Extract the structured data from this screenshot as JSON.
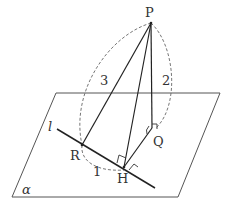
{
  "diagram": {
    "type": "3d-geometry",
    "plane": {
      "label": "α",
      "corners": [
        [
          56,
          93
        ],
        [
          220,
          93
        ],
        [
          178,
          197
        ],
        [
          12,
          197
        ]
      ]
    },
    "line": {
      "label": "l",
      "from": [
        57,
        129
      ],
      "to": [
        155,
        188
      ]
    },
    "points": {
      "P": {
        "label": "P",
        "pos": [
          151,
          23
        ]
      },
      "R": {
        "label": "R",
        "pos": [
          82,
          145
        ]
      },
      "H": {
        "label": "H",
        "pos": [
          124,
          167
        ]
      },
      "Q": {
        "label": "Q",
        "pos": [
          152,
          128
        ]
      }
    },
    "segments": [
      {
        "name": "PR",
        "from": "P",
        "to": "R"
      },
      {
        "name": "PH",
        "from": "P",
        "to": "H"
      },
      {
        "name": "PQ",
        "from": "P",
        "to": "Q"
      },
      {
        "name": "QH",
        "from": "Q",
        "to": "H"
      }
    ],
    "lengths": {
      "PR": "3",
      "PQ": "2",
      "RH": "1"
    },
    "right_angles": [
      "PQ ⊥ plane at Q",
      "PH ⊥ l at H",
      "QH ⊥ l at H"
    ],
    "colors": {
      "stroke": "#222222",
      "plane": "#555555",
      "dashed": "#666666"
    }
  }
}
